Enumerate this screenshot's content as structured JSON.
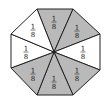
{
  "diagram": {
    "shape": "regular octagon divided into 8 equal triangular sectors",
    "center": [
      54,
      52
    ],
    "vertices": [
      [
        37,
        9
      ],
      [
        73,
        9
      ],
      [
        100,
        34
      ],
      [
        100,
        70
      ],
      [
        73,
        95
      ],
      [
        37,
        95
      ],
      [
        11,
        68
      ],
      [
        11,
        34
      ]
    ],
    "colors": {
      "shaded": "#b9b9b9",
      "unshaded": "#ffffff",
      "stroke": "#222222"
    },
    "sectors": [
      {
        "position": "top",
        "numerator": "1",
        "denominator": "8",
        "shaded": true,
        "label_pos": [
          54,
          22
        ]
      },
      {
        "position": "top-right",
        "numerator": "1",
        "denominator": "8",
        "shaded": true,
        "label_pos": [
          77,
          31
        ]
      },
      {
        "position": "right",
        "numerator": "1",
        "denominator": "8",
        "shaded": false,
        "label_pos": [
          83,
          52
        ]
      },
      {
        "position": "bottom-right",
        "numerator": "1",
        "denominator": "8",
        "shaded": true,
        "label_pos": [
          77,
          74
        ]
      },
      {
        "position": "bottom",
        "numerator": "1",
        "denominator": "8",
        "shaded": true,
        "label_pos": [
          54,
          82
        ]
      },
      {
        "position": "bottom-left",
        "numerator": "1",
        "denominator": "8",
        "shaded": true,
        "label_pos": [
          33,
          74
        ]
      },
      {
        "position": "left",
        "numerator": "1",
        "denominator": "8",
        "shaded": false,
        "label_pos": [
          26,
          52
        ]
      },
      {
        "position": "top-left",
        "numerator": "1",
        "denominator": "8",
        "shaded": false,
        "label_pos": [
          33,
          30
        ]
      }
    ]
  }
}
